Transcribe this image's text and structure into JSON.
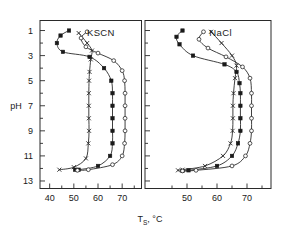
{
  "figure": {
    "xlabel_main": "T",
    "xlabel_sub": "S",
    "xlabel_unit": ", °C",
    "ylabel": "pH"
  },
  "chart_data": {
    "type": "line",
    "title": "",
    "xlabel": "T_S , °C",
    "ylabel": "pH",
    "xlim": [
      36,
      78
    ],
    "ylim": [
      0.2,
      13.6
    ],
    "y_inverted": true,
    "grid": false,
    "legend_position": "none",
    "y_ticks_major": [
      1,
      3,
      5,
      7,
      9,
      11,
      13
    ],
    "y_ticks_minor": [
      2,
      4,
      6,
      8,
      10,
      12
    ],
    "panels": [
      {
        "name": "left",
        "label": "KSCN",
        "x_ticks": [
          40,
          50,
          60,
          70
        ],
        "x_minor_ticks": [
          45,
          55,
          65,
          75
        ],
        "series": [
          {
            "name": "series-x",
            "marker": "cross",
            "points": [
              [
                52.0,
                1.2
              ],
              [
                55.5,
                2.0
              ],
              [
                57.5,
                2.6
              ],
              [
                57.0,
                3.3
              ],
              [
                56.5,
                4.3
              ],
              [
                56.3,
                5.0
              ],
              [
                56.2,
                6.0
              ],
              [
                56.2,
                7.0
              ],
              [
                56.2,
                8.0
              ],
              [
                56.3,
                9.0
              ],
              [
                56.0,
                10.0
              ],
              [
                55.0,
                11.2
              ],
              [
                50.0,
                11.9
              ],
              [
                44.0,
                12.1
              ]
            ]
          },
          {
            "name": "series-filled-square",
            "marker": "filled-square",
            "points": [
              [
                48.0,
                1.0
              ],
              [
                44.5,
                1.4
              ],
              [
                43.0,
                2.0
              ],
              [
                45.5,
                2.7
              ],
              [
                56.5,
                3.1
              ],
              [
                62.5,
                4.0
              ],
              [
                65.5,
                5.0
              ],
              [
                66.0,
                6.0
              ],
              [
                66.0,
                7.0
              ],
              [
                66.0,
                8.0
              ],
              [
                66.0,
                9.0
              ],
              [
                66.0,
                10.0
              ],
              [
                65.0,
                11.0
              ],
              [
                60.0,
                11.8
              ],
              [
                52.0,
                12.1
              ],
              [
                50.5,
                12.1
              ]
            ]
          },
          {
            "name": "series-open-circle",
            "marker": "open-circle",
            "points": [
              [
                55.5,
                1.1
              ],
              [
                53.0,
                1.6
              ],
              [
                55.0,
                2.3
              ],
              [
                60.0,
                2.8
              ],
              [
                66.5,
                3.4
              ],
              [
                70.0,
                4.2
              ],
              [
                71.0,
                5.0
              ],
              [
                71.2,
                6.0
              ],
              [
                71.2,
                7.0
              ],
              [
                71.2,
                8.0
              ],
              [
                71.2,
                9.0
              ],
              [
                71.0,
                10.0
              ],
              [
                70.0,
                11.0
              ],
              [
                66.0,
                11.7
              ],
              [
                56.0,
                12.1
              ],
              [
                51.5,
                12.15
              ]
            ]
          }
        ]
      },
      {
        "name": "right",
        "label": "NaCl",
        "x_ticks": [
          50,
          60,
          70
        ],
        "x_minor_ticks": [
          45,
          55,
          65,
          75
        ],
        "series": [
          {
            "name": "series-x",
            "marker": "cross",
            "points": [
              [
                58.0,
                1.1
              ],
              [
                61.5,
                2.0
              ],
              [
                65.0,
                3.0
              ],
              [
                66.5,
                3.8
              ],
              [
                66.0,
                4.8
              ],
              [
                65.5,
                6.0
              ],
              [
                65.3,
                7.0
              ],
              [
                65.3,
                8.0
              ],
              [
                65.2,
                9.0
              ],
              [
                64.5,
                10.0
              ],
              [
                62.0,
                11.0
              ],
              [
                56.0,
                11.8
              ],
              [
                48.5,
                12.1
              ],
              [
                47.0,
                12.15
              ]
            ]
          },
          {
            "name": "series-filled-square",
            "marker": "filled-square",
            "points": [
              [
                48.5,
                1.0
              ],
              [
                46.5,
                1.5
              ],
              [
                47.5,
                2.1
              ],
              [
                52.0,
                3.0
              ],
              [
                62.5,
                3.7
              ],
              [
                66.5,
                4.3
              ],
              [
                67.5,
                5.2
              ],
              [
                67.8,
                6.0
              ],
              [
                67.8,
                7.0
              ],
              [
                67.8,
                8.0
              ],
              [
                67.8,
                9.0
              ],
              [
                67.0,
                10.0
              ],
              [
                65.0,
                11.0
              ],
              [
                60.0,
                11.8
              ],
              [
                50.5,
                12.15
              ],
              [
                48.5,
                12.2
              ]
            ]
          },
          {
            "name": "series-open-circle",
            "marker": "open-circle",
            "points": [
              [
                55.5,
                1.1
              ],
              [
                54.0,
                1.7
              ],
              [
                57.0,
                2.4
              ],
              [
                63.0,
                3.1
              ],
              [
                68.5,
                3.9
              ],
              [
                71.0,
                4.8
              ],
              [
                71.5,
                6.0
              ],
              [
                71.5,
                7.0
              ],
              [
                71.5,
                8.0
              ],
              [
                71.5,
                9.0
              ],
              [
                71.0,
                10.0
              ],
              [
                69.5,
                11.0
              ],
              [
                65.0,
                11.8
              ],
              [
                53.0,
                12.15
              ],
              [
                48.5,
                12.2
              ]
            ]
          }
        ]
      }
    ]
  }
}
